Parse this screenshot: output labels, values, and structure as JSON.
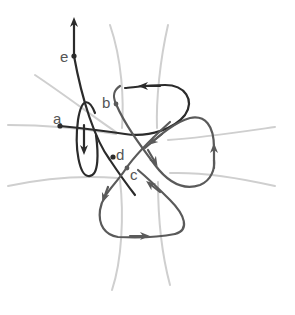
{
  "diagram": {
    "type": "knot-projection-with-flow-paths",
    "labels": {
      "a": "a",
      "b": "b",
      "c": "c",
      "d": "d",
      "e": "e"
    },
    "colors": {
      "background": "#ffffff",
      "faint_curves": "#cfcfcf",
      "dark_path": "#2b2b2b",
      "mid_path": "#5a5a5a",
      "label": "#555555"
    }
  }
}
